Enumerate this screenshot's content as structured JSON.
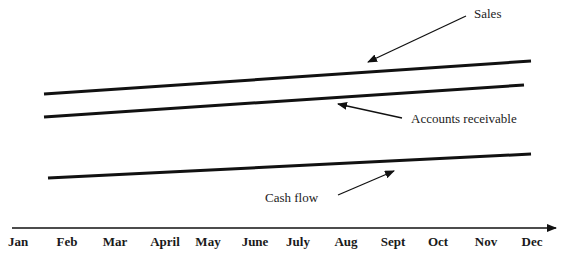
{
  "diagram": {
    "lines": [
      {
        "name": "Sales",
        "x1": 44,
        "y1": 94,
        "x2": 531,
        "y2": 61
      },
      {
        "name": "Accounts receivable",
        "x1": 44,
        "y1": 117,
        "x2": 524,
        "y2": 85
      },
      {
        "name": "Cash flow",
        "x1": 48,
        "y1": 178,
        "x2": 531,
        "y2": 154
      }
    ],
    "annotations": {
      "sales": "Sales",
      "accounts_receivable": "Accounts receivable",
      "cash_flow": "Cash flow"
    },
    "axis": {
      "months": [
        "Jan",
        "Feb",
        "Mar",
        "April",
        "May",
        "June",
        "July",
        "Aug",
        "Sept",
        "Oct",
        "Nov",
        "Dec"
      ]
    },
    "colors": {
      "line": "#111111",
      "text": "#222222"
    }
  }
}
